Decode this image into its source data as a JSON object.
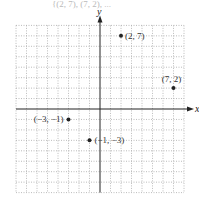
{
  "header": {
    "partial_text": "{(2, 7), (7, 2), ..."
  },
  "chart_data": {
    "type": "scatter",
    "title": "",
    "xlabel": "x",
    "ylabel": "y",
    "xlim": [
      -8,
      8
    ],
    "ylim": [
      -8,
      8
    ],
    "grid": true,
    "points": [
      {
        "x": 2,
        "y": 7,
        "label": "(2, 7)"
      },
      {
        "x": 7,
        "y": 2,
        "label": "(7, 2)"
      },
      {
        "x": -3,
        "y": -1,
        "label": "(−3, −1)"
      },
      {
        "x": -1,
        "y": -3,
        "label": "(−1, −3)"
      }
    ]
  },
  "style": {
    "grid_color": "#aaaaaa",
    "axis_color": "#222222",
    "point_color": "#222222"
  }
}
